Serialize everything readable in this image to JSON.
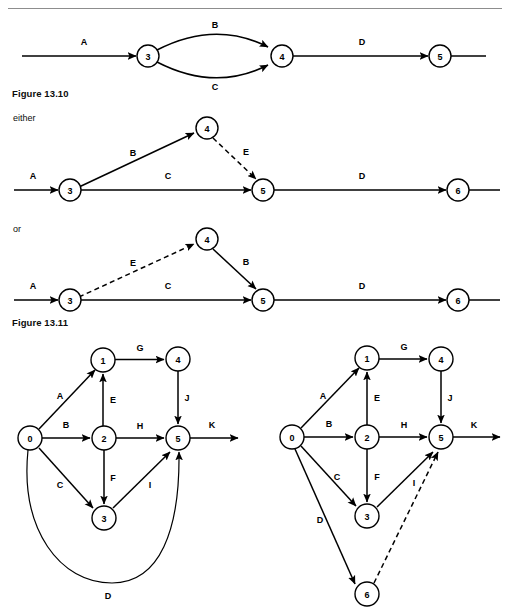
{
  "page": {
    "width": 508,
    "height": 607,
    "background": "#ffffff",
    "rule_color": "#8d8d8d",
    "ink_color": "#000000"
  },
  "captions": {
    "figure_13_10": "Figure 13.10",
    "figure_13_11": "Figure 13.11"
  },
  "runin_labels": {
    "either": "either",
    "or": "or"
  },
  "figures": [
    {
      "id": "figure-13-10",
      "caption": "Figure 13.10",
      "description": "Activity-on-arrow network with parallel activities B and C between events 3 and 4",
      "nodes": [
        {
          "id": "n3",
          "label": "3",
          "cx": 148,
          "cy": 56,
          "r": 11
        },
        {
          "id": "n4",
          "label": "4",
          "cx": 282,
          "cy": 56,
          "r": 11
        },
        {
          "id": "n5",
          "label": "5",
          "cx": 440,
          "cy": 56,
          "r": 11
        }
      ],
      "edges": [
        {
          "label": "A",
          "from": "entry",
          "to": "n3",
          "style": "solid",
          "lx": 84,
          "ly": 42
        },
        {
          "label": "B",
          "from": "n3",
          "to": "n4",
          "style": "solid",
          "curve": "up",
          "lx": 215,
          "ly": 25
        },
        {
          "label": "C",
          "from": "n3",
          "to": "n4",
          "style": "solid",
          "curve": "down",
          "lx": 215,
          "ly": 87
        },
        {
          "label": "D",
          "from": "n4",
          "to": "n5",
          "style": "solid",
          "lx": 362,
          "ly": 42
        },
        {
          "label": "",
          "from": "n5",
          "to": "exit",
          "style": "solid",
          "lx": 0,
          "ly": 0
        }
      ]
    },
    {
      "id": "figure-13-11-either",
      "caption": "either",
      "description": "Network with dummy activity E drawn from event 4 to event 5",
      "nodes": [
        {
          "id": "n3",
          "label": "3",
          "cx": 70,
          "cy": 190,
          "r": 11
        },
        {
          "id": "n4",
          "label": "4",
          "cx": 207,
          "cy": 128,
          "r": 11
        },
        {
          "id": "n5",
          "label": "5",
          "cx": 263,
          "cy": 190,
          "r": 11
        },
        {
          "id": "n6",
          "label": "6",
          "cx": 458,
          "cy": 190,
          "r": 11
        }
      ],
      "edges": [
        {
          "label": "A",
          "from": "entry",
          "to": "n3",
          "style": "solid",
          "lx": 33,
          "ly": 176
        },
        {
          "label": "B",
          "from": "n3",
          "to": "n4",
          "style": "solid",
          "lx": 133,
          "ly": 153
        },
        {
          "label": "E",
          "from": "n4",
          "to": "n5",
          "style": "dashed",
          "lx": 244,
          "ly": 153
        },
        {
          "label": "C",
          "from": "n3",
          "to": "n5",
          "style": "solid",
          "lx": 168,
          "ly": 176
        },
        {
          "label": "D",
          "from": "n5",
          "to": "n6",
          "style": "solid",
          "lx": 362,
          "ly": 176
        }
      ]
    },
    {
      "id": "figure-13-11-or",
      "caption": "or",
      "description": "Alternative network with dummy activity E drawn from event 3 to event 4",
      "nodes": [
        {
          "id": "n3",
          "label": "3",
          "cx": 70,
          "cy": 300,
          "r": 11
        },
        {
          "id": "n4",
          "label": "4",
          "cx": 207,
          "cy": 239,
          "r": 11
        },
        {
          "id": "n5",
          "label": "5",
          "cx": 263,
          "cy": 300,
          "r": 11
        },
        {
          "id": "n6",
          "label": "6",
          "cx": 458,
          "cy": 300,
          "r": 11
        }
      ],
      "edges": [
        {
          "label": "A",
          "from": "entry",
          "to": "n3",
          "style": "solid",
          "lx": 33,
          "ly": 286
        },
        {
          "label": "E",
          "from": "n3",
          "to": "n4",
          "style": "dashed",
          "lx": 133,
          "ly": 264
        },
        {
          "label": "B",
          "from": "n4",
          "to": "n5",
          "style": "solid",
          "lx": 244,
          "ly": 264
        },
        {
          "label": "C",
          "from": "n3",
          "to": "n5",
          "style": "solid",
          "lx": 168,
          "ly": 286
        },
        {
          "label": "D",
          "from": "n5",
          "to": "n6",
          "style": "solid",
          "lx": 362,
          "ly": 286
        }
      ]
    },
    {
      "id": "figure-left-network",
      "caption": "",
      "description": "Activity network with events 0 to 5 and activity D as a long loop back arc from event 0 to event 5",
      "nodes": [
        {
          "id": "n0",
          "label": "0",
          "cx": 30,
          "cy": 438,
          "r": 12
        },
        {
          "id": "n1",
          "label": "1",
          "cx": 103,
          "cy": 360,
          "r": 12
        },
        {
          "id": "n2",
          "label": "2",
          "cx": 104,
          "cy": 438,
          "r": 12
        },
        {
          "id": "n3",
          "label": "3",
          "cx": 104,
          "cy": 518,
          "r": 12
        },
        {
          "id": "n4",
          "label": "4",
          "cx": 178,
          "cy": 359,
          "r": 12
        },
        {
          "id": "n5",
          "label": "5",
          "cx": 178,
          "cy": 438,
          "r": 12
        }
      ],
      "edges": [
        {
          "label": "A",
          "from": "n0",
          "to": "n1",
          "style": "solid",
          "lx": 61,
          "ly": 397
        },
        {
          "label": "B",
          "from": "n0",
          "to": "n2",
          "style": "solid",
          "lx": 66,
          "ly": 425
        },
        {
          "label": "C",
          "from": "n0",
          "to": "n3",
          "style": "solid",
          "lx": 61,
          "ly": 485
        },
        {
          "label": "D",
          "from": "n0",
          "to": "n5",
          "style": "solid",
          "curve": "arc",
          "lx": 108,
          "ly": 585
        },
        {
          "label": "E",
          "from": "n2",
          "to": "n1",
          "style": "solid",
          "lx": 112,
          "ly": 400
        },
        {
          "label": "F",
          "from": "n2",
          "to": "n3",
          "style": "solid",
          "lx": 112,
          "ly": 478
        },
        {
          "label": "G",
          "from": "n1",
          "to": "n4",
          "style": "solid",
          "lx": 140,
          "ly": 348
        },
        {
          "label": "H",
          "from": "n2",
          "to": "n5",
          "style": "solid",
          "lx": 140,
          "ly": 426
        },
        {
          "label": "I",
          "from": "n3",
          "to": "n5",
          "style": "solid",
          "lx": 148,
          "ly": 485
        },
        {
          "label": "J",
          "from": "n4",
          "to": "n5",
          "style": "solid",
          "lx": 186,
          "ly": 398
        },
        {
          "label": "K",
          "from": "n5",
          "to": "exit",
          "style": "solid",
          "lx": 210,
          "ly": 425
        }
      ]
    },
    {
      "id": "figure-right-network",
      "caption": "",
      "description": "Redrawn activity network with extra event 6 and dummy activity I from event 6 to event 5",
      "nodes": [
        {
          "id": "n0",
          "label": "0",
          "cx": 292,
          "cy": 437,
          "r": 12
        },
        {
          "id": "n1",
          "label": "1",
          "cx": 367,
          "cy": 358,
          "r": 12
        },
        {
          "id": "n2",
          "label": "2",
          "cx": 367,
          "cy": 437,
          "r": 12
        },
        {
          "id": "n3",
          "label": "3",
          "cx": 367,
          "cy": 516,
          "r": 12
        },
        {
          "id": "n4",
          "label": "4",
          "cx": 441,
          "cy": 359,
          "r": 12
        },
        {
          "id": "n5",
          "label": "5",
          "cx": 441,
          "cy": 437,
          "r": 12
        },
        {
          "id": "n6",
          "label": "6",
          "cx": 367,
          "cy": 594,
          "r": 12
        }
      ],
      "edges": [
        {
          "label": "A",
          "from": "n0",
          "to": "n1",
          "style": "solid",
          "lx": 322,
          "ly": 396
        },
        {
          "label": "B",
          "from": "n0",
          "to": "n2",
          "style": "solid",
          "lx": 329,
          "ly": 424
        },
        {
          "label": "C",
          "from": "n0",
          "to": "n3",
          "style": "solid",
          "lx": 336,
          "ly": 477
        },
        {
          "label": "D",
          "from": "n0",
          "to": "n6",
          "style": "solid",
          "lx": 320,
          "ly": 518
        },
        {
          "label": "E",
          "from": "n2",
          "to": "n1",
          "style": "solid",
          "lx": 376,
          "ly": 398
        },
        {
          "label": "F",
          "from": "n2",
          "to": "n3",
          "style": "solid",
          "lx": 376,
          "ly": 477
        },
        {
          "label": "G",
          "from": "n1",
          "to": "n4",
          "style": "solid",
          "lx": 404,
          "ly": 347
        },
        {
          "label": "H",
          "from": "n2",
          "to": "n5",
          "style": "solid",
          "lx": 404,
          "ly": 425
        },
        {
          "label": "I",
          "from": "n6",
          "to": "n5",
          "style": "dashed",
          "lx": 412,
          "ly": 483
        },
        {
          "label": "J",
          "from": "n4",
          "to": "n5",
          "style": "solid",
          "lx": 449,
          "ly": 398
        },
        {
          "label": "K",
          "from": "n5",
          "to": "exit",
          "style": "solid",
          "lx": 473,
          "ly": 425
        }
      ]
    }
  ]
}
